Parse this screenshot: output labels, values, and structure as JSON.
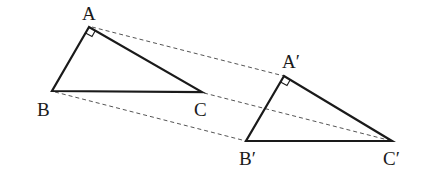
{
  "diagram": {
    "type": "geometry-similar-triangles",
    "triangle_original": {
      "vertices": [
        {
          "name": "A",
          "x": 89,
          "y": 27,
          "label": "A",
          "label_x": 83,
          "label_y": 3
        },
        {
          "name": "B",
          "x": 52,
          "y": 91,
          "label": "B",
          "label_x": 37,
          "label_y": 101
        },
        {
          "name": "C",
          "x": 202,
          "y": 92,
          "label": "C",
          "label_x": 194,
          "label_y": 101
        }
      ],
      "right_angle_at": "A"
    },
    "triangle_image": {
      "vertices": [
        {
          "name": "A'",
          "x": 284,
          "y": 76,
          "label": "A′",
          "label_x": 282,
          "label_y": 52
        },
        {
          "name": "B'",
          "x": 246,
          "y": 141,
          "label": "B′",
          "label_x": 239,
          "label_y": 150
        },
        {
          "name": "C'",
          "x": 392,
          "y": 141,
          "label": "C′",
          "label_x": 383,
          "label_y": 150
        }
      ],
      "right_angle_at": "A'"
    },
    "correspondence_lines": [
      {
        "from": "A",
        "to": "A'",
        "style": "dashed"
      },
      {
        "from": "B",
        "to": "B'",
        "style": "dashed"
      },
      {
        "from": "C",
        "to": "C'",
        "style": "dashed"
      }
    ],
    "colors": {
      "stroke": "#1a1a1a",
      "dashed": "#555555",
      "background": "#ffffff"
    }
  },
  "labels": {
    "A": "A",
    "B": "B",
    "C": "C",
    "A_prime": "A′",
    "B_prime": "B′",
    "C_prime": "C′"
  }
}
